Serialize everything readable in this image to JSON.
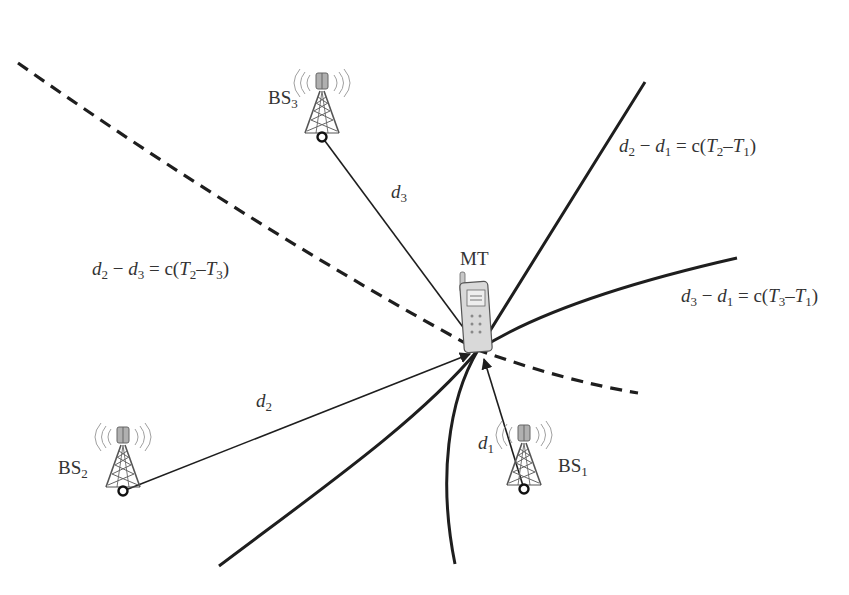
{
  "diagram": {
    "intersection": {
      "x": 478,
      "y": 350
    },
    "mobile_terminal": {
      "label": "MT",
      "x": 478,
      "y": 300
    },
    "base_stations": [
      {
        "id": "BS1",
        "label_main": "BS",
        "label_sub": "1",
        "antenna_x": 524,
        "antenna_y": 489
      },
      {
        "id": "BS2",
        "label_main": "BS",
        "label_sub": "2",
        "antenna_x": 123,
        "antenna_y": 491
      },
      {
        "id": "BS3",
        "label_main": "BS",
        "label_sub": "3",
        "antenna_x": 322,
        "antenna_y": 137
      }
    ],
    "distances": [
      {
        "id": "d1",
        "main": "d",
        "sub": "1"
      },
      {
        "id": "d2",
        "main": "d",
        "sub": "2"
      },
      {
        "id": "d3",
        "main": "d",
        "sub": "3"
      }
    ],
    "equations": [
      {
        "id": "eq21",
        "lhs_a": "d",
        "lhs_a_sub": "2",
        "op": "−",
        "lhs_b": "d",
        "lhs_b_sub": "1",
        "eq": "= c(",
        "t_a": "T",
        "t_a_sub": "2",
        "dash": "–",
        "t_b": "T",
        "t_b_sub": "1",
        "close": ")",
        "line_style": "solid"
      },
      {
        "id": "eq31",
        "lhs_a": "d",
        "lhs_a_sub": "3",
        "op": "−",
        "lhs_b": "d",
        "lhs_b_sub": "1",
        "eq": "= c(",
        "t_a": "T",
        "t_a_sub": "3",
        "dash": "–",
        "t_b": "T",
        "t_b_sub": "1",
        "close": ")",
        "line_style": "solid"
      },
      {
        "id": "eq23",
        "lhs_a": "d",
        "lhs_a_sub": "2",
        "op": "−",
        "lhs_b": "d",
        "lhs_b_sub": "3",
        "eq": "= c(",
        "t_a": "T",
        "t_a_sub": "2",
        "dash": "–",
        "t_b": "T",
        "t_b_sub": "3",
        "close": ")",
        "line_style": "dashed"
      }
    ],
    "colors": {
      "curve": "#1e1e1e",
      "tower": "#555555",
      "wave": "#9a9a9a",
      "text": "#333333"
    }
  }
}
